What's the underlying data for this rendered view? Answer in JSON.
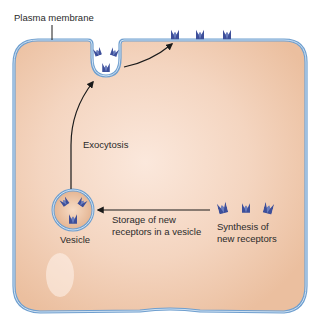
{
  "labels": {
    "plasma_membrane": "Plasma membrane",
    "exocytosis": "Exocytosis",
    "vesicle": "Vesicle",
    "storage_line1": "Storage of new",
    "storage_line2": "receptors in a vesicle",
    "synthesis_line1": "Synthesis of",
    "synthesis_line2": "new receptors"
  },
  "colors": {
    "cytoplasm": "#f1cdb3",
    "cytoplasm_light": "#fbe6d9",
    "membrane_outer": "#6f9fcf",
    "membrane_inner": "#bcd5ec",
    "receptor": "#3d4f9a",
    "receptor_light": "#7f93cf",
    "arrow": "#1a1a1a"
  },
  "receptors": {
    "surface_count": 3,
    "synthesis_count": 3,
    "vesicle_count": 3,
    "fusing_count": 3
  }
}
